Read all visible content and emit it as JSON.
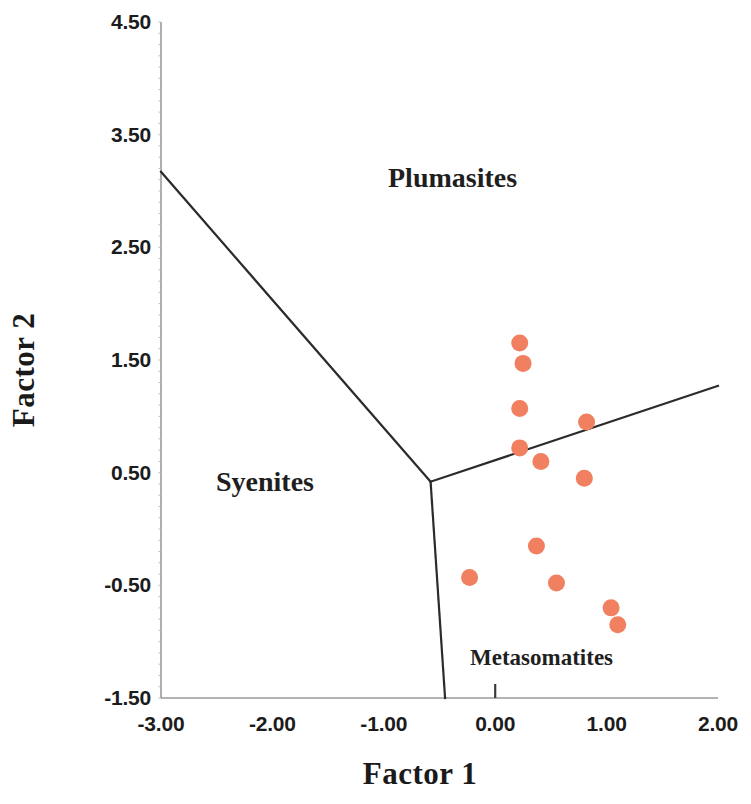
{
  "chart_data": {
    "type": "scatter",
    "title": "",
    "xlabel": "Factor 1",
    "ylabel": "Factor 2",
    "xlim": [
      -3.0,
      2.0
    ],
    "ylim": [
      -1.5,
      4.5
    ],
    "xticks": [
      "-3.00",
      "-2.00",
      "-1.00",
      "0.00",
      "1.00",
      "2.00"
    ],
    "xtick_values": [
      -3.0,
      -2.0,
      -1.0,
      0.0,
      1.0,
      2.0
    ],
    "yticks": [
      "4.50",
      "3.50",
      "2.50",
      "1.50",
      "0.50",
      "-0.50",
      "-1.50"
    ],
    "ytick_values": [
      4.5,
      3.5,
      2.5,
      1.5,
      0.5,
      -0.5,
      -1.5
    ],
    "grid": false,
    "legend": null,
    "marker_color": "#F0805F",
    "marker_size": 17,
    "series": [
      {
        "name": "samples",
        "points": [
          {
            "x": 0.22,
            "y": 1.65
          },
          {
            "x": 0.25,
            "y": 1.47
          },
          {
            "x": 0.22,
            "y": 1.07
          },
          {
            "x": 0.82,
            "y": 0.95
          },
          {
            "x": 0.22,
            "y": 0.72
          },
          {
            "x": 0.41,
            "y": 0.6
          },
          {
            "x": 0.8,
            "y": 0.45
          },
          {
            "x": 0.37,
            "y": -0.15
          },
          {
            "x": -0.23,
            "y": -0.43
          },
          {
            "x": 0.55,
            "y": -0.48
          },
          {
            "x": 1.04,
            "y": -0.7
          },
          {
            "x": 1.1,
            "y": -0.85
          }
        ]
      }
    ],
    "annotations": [
      {
        "text": "Plumasites",
        "x": 0.6,
        "y": 3.0
      },
      {
        "text": "Syenites",
        "x": -1.9,
        "y": 0.6
      },
      {
        "text": "Metasomatites",
        "x": 0.6,
        "y": -1.15
      }
    ],
    "boundaries": [
      {
        "name": "syenites-plumasites-boundary",
        "path": [
          {
            "x": -3.0,
            "y": 3.17
          },
          {
            "x": -0.58,
            "y": 0.42
          }
        ]
      },
      {
        "name": "plumasites-metasomatites-boundary",
        "path": [
          {
            "x": -0.58,
            "y": 0.42
          },
          {
            "x": 2.0,
            "y": 1.27
          }
        ]
      },
      {
        "name": "syenites-metasomatites-boundary",
        "path": [
          {
            "x": -0.58,
            "y": 0.42
          },
          {
            "x": -0.45,
            "y": -1.5
          }
        ]
      }
    ]
  },
  "axes": {
    "xlabel": "Factor 1",
    "ylabel": "Factor 2"
  },
  "regions": {
    "plumasites": "Plumasites",
    "syenites": "Syenites",
    "metasomatites": "Metasomatites"
  }
}
